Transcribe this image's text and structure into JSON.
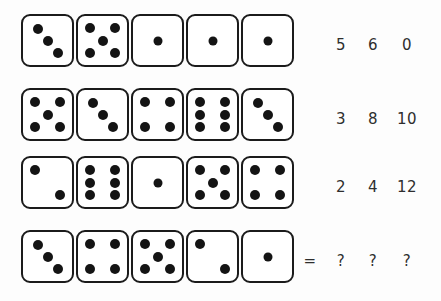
{
  "puzzle": {
    "title": "dice-sequence-puzzle",
    "dot_color": "#141414",
    "die_border_color": "#1b1b1b",
    "die_face_color": "#ffffff",
    "background_color": "#fdfdfd",
    "text_color": "#2e2e2e",
    "equals_symbol": "=",
    "rows": [
      {
        "id": "row-1",
        "dice": [
          3,
          5,
          1,
          1,
          1
        ],
        "numbers": [
          "5",
          "6",
          "0"
        ],
        "equals": "",
        "is_answer_row": false
      },
      {
        "id": "row-2",
        "dice": [
          5,
          3,
          4,
          6,
          3
        ],
        "numbers": [
          "3",
          "8",
          "10"
        ],
        "equals": "",
        "is_answer_row": false
      },
      {
        "id": "row-3",
        "dice": [
          2,
          6,
          1,
          5,
          4
        ],
        "numbers": [
          "2",
          "4",
          "12"
        ],
        "equals": "",
        "is_answer_row": false
      },
      {
        "id": "row-4",
        "dice": [
          3,
          4,
          5,
          2,
          1
        ],
        "numbers": [
          "?",
          "?",
          "?"
        ],
        "equals": "=",
        "is_answer_row": true
      }
    ]
  }
}
